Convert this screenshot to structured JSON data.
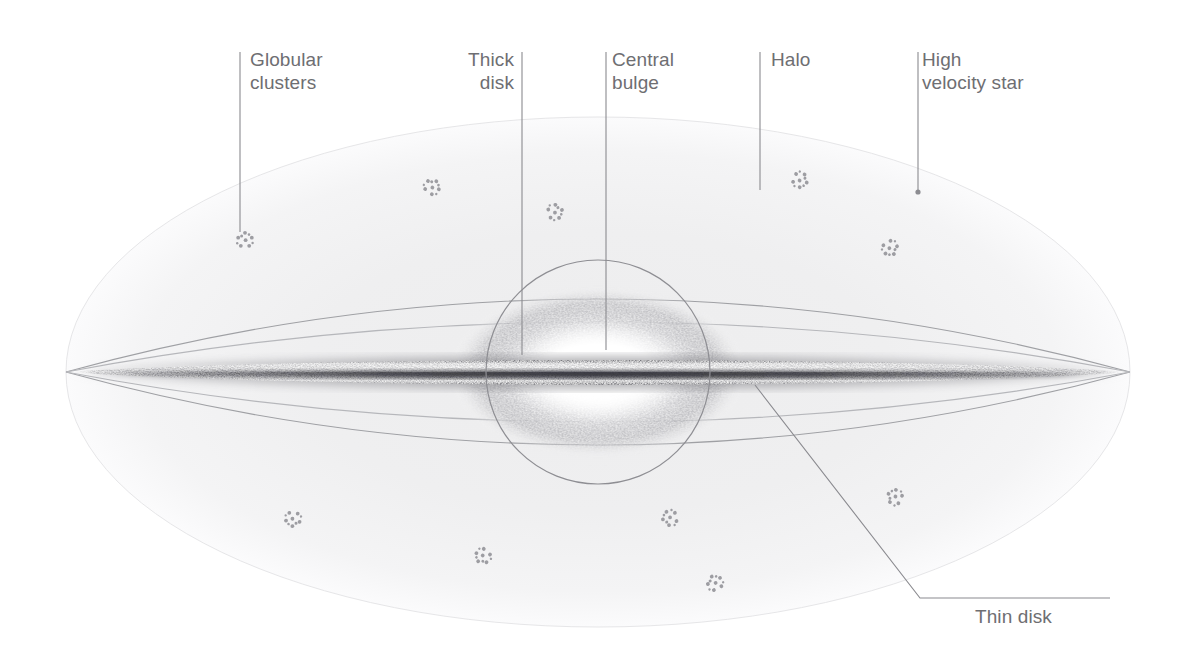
{
  "diagram": {
    "background_color": "#ffffff",
    "label_color": "#6e6e72",
    "leader_color": "#8a8a8f",
    "halo_color": "#f1f1f2",
    "outline_color": "#9b9b9f",
    "cluster_color": "#9d9da2"
  },
  "labels": {
    "globular_clusters": "Globular\nclusters",
    "thick_disk": "Thick\ndisk",
    "central_bulge": "Central\nbulge",
    "halo": "Halo",
    "high_velocity_star": "High\nvelocity star",
    "thin_disk": "Thin disk"
  },
  "chart_data": {
    "type": "diagram",
    "components": [
      {
        "name": "halo",
        "label": "Halo",
        "shape": "ellipse",
        "center_x": 598,
        "center_y": 372,
        "radius_x": 532,
        "radius_y": 255,
        "fill": "#f2f2f3"
      },
      {
        "name": "thick-disk",
        "label": "Thick disk",
        "shape": "lens-ellipse-pair",
        "center_x": 598,
        "center_y": 372,
        "half_width": 532,
        "upper_bulge_y": 272,
        "lower_bulge_y": 455,
        "stroke": "#9b9b9f"
      },
      {
        "name": "central-bulge",
        "label": "Central bulge",
        "shape": "circle",
        "center_x": 598,
        "center_y": 372,
        "radius": 112,
        "stroke": "#8e8e93"
      },
      {
        "name": "thin-disk",
        "label": "Thin disk",
        "shape": "tapered-band",
        "center_x": 598,
        "center_y": 374,
        "half_width": 534,
        "half_thickness": 30,
        "dark_lane_y": 381
      },
      {
        "name": "high-velocity-star",
        "label": "High velocity star",
        "shape": "dot",
        "x": 918,
        "y": 192
      }
    ],
    "globular_clusters": [
      {
        "x": 245,
        "y": 240
      },
      {
        "x": 432,
        "y": 187
      },
      {
        "x": 555,
        "y": 212
      },
      {
        "x": 800,
        "y": 180
      },
      {
        "x": 890,
        "y": 248
      },
      {
        "x": 293,
        "y": 519
      },
      {
        "x": 483,
        "y": 556
      },
      {
        "x": 670,
        "y": 518
      },
      {
        "x": 895,
        "y": 497
      },
      {
        "x": 715,
        "y": 583
      }
    ],
    "leader_lines": [
      {
        "target": "globular_clusters",
        "x1": 240,
        "y1": 52,
        "x2": 240,
        "y2": 232
      },
      {
        "target": "thick_disk",
        "x1": 522,
        "y1": 52,
        "x2": 522,
        "y2": 355
      },
      {
        "target": "central_bulge",
        "x1": 606,
        "y1": 52,
        "x2": 606,
        "y2": 350
      },
      {
        "target": "halo",
        "x1": 760,
        "y1": 52,
        "x2": 760,
        "y2": 190
      },
      {
        "target": "high_velocity_star",
        "x1": 918,
        "y1": 52,
        "x2": 918,
        "y2": 192
      },
      {
        "target": "thin_disk",
        "polyline": "755,385 920,598 1110,598"
      }
    ]
  }
}
